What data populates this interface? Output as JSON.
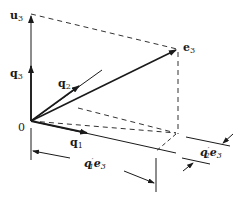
{
  "diagram": {
    "type": "vector-decomposition",
    "origin_label": "0",
    "vectors": [
      {
        "id": "u3",
        "label": "u",
        "subscript": "3",
        "style": "solid-arrow"
      },
      {
        "id": "q3",
        "label": "q",
        "subscript": "3",
        "style": "solid-arrow"
      },
      {
        "id": "q2",
        "label": "q",
        "subscript": "2",
        "style": "solid-arrow"
      },
      {
        "id": "q1",
        "label": "q",
        "subscript": "1",
        "style": "solid-arrow"
      },
      {
        "id": "e3",
        "label": "e",
        "subscript": "3",
        "style": "solid-arrow"
      }
    ],
    "dimensions": [
      {
        "id": "q1-prime-e3",
        "label_main": "q",
        "label_sub": "1",
        "label_prime": "′",
        "label_tail": "e",
        "label_tail_sub": "3"
      },
      {
        "id": "q2-prime-e3",
        "label_main": "q",
        "label_sub": "2",
        "label_prime": "′",
        "label_tail": "e",
        "label_tail_sub": "3"
      }
    ],
    "colors": {
      "stroke": "#1a1a1a",
      "background": "#ffffff"
    }
  }
}
